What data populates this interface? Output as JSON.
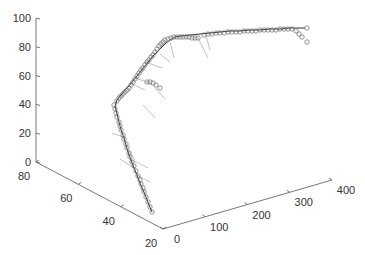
{
  "chart_data": {
    "type": "scatter3d",
    "title": "",
    "xlabel": "",
    "ylabel": "",
    "zlabel": "",
    "xlim": [
      0,
      400
    ],
    "ylim": [
      20,
      80
    ],
    "zlim": [
      0,
      100
    ],
    "x_ticks": [
      "0",
      "100",
      "200",
      "300",
      "400"
    ],
    "y_ticks": [
      "20",
      "40",
      "60",
      "80"
    ],
    "z_ticks": [
      "0",
      "20",
      "40",
      "60",
      "80",
      "100"
    ],
    "grid": false,
    "legend": [],
    "series": [
      {
        "name": "fitted-curve",
        "style": "line",
        "color": "#333333"
      },
      {
        "name": "observations",
        "style": "circle-markers",
        "color": "#555555"
      },
      {
        "name": "residual-vectors",
        "style": "thin-lines",
        "color": "#aaaaaa"
      }
    ],
    "screen_path_points": [
      [
        152,
        212
      ],
      [
        149,
        205
      ],
      [
        146,
        197
      ],
      [
        143,
        190
      ],
      [
        140,
        183
      ],
      [
        137,
        175
      ],
      [
        134,
        168
      ],
      [
        131,
        160
      ],
      [
        128,
        152
      ],
      [
        126,
        145
      ],
      [
        124,
        138
      ],
      [
        121,
        130
      ],
      [
        119,
        122
      ],
      [
        117,
        114
      ],
      [
        115,
        106
      ],
      [
        117,
        100
      ],
      [
        121,
        95
      ],
      [
        125,
        90
      ],
      [
        129,
        86
      ],
      [
        133,
        81
      ],
      [
        137,
        76
      ],
      [
        141,
        71
      ],
      [
        145,
        66
      ],
      [
        149,
        61
      ],
      [
        153,
        56
      ],
      [
        157,
        52
      ],
      [
        161,
        48
      ],
      [
        165,
        44
      ],
      [
        170,
        40
      ],
      [
        175,
        37
      ],
      [
        180,
        36
      ],
      [
        190,
        35
      ],
      [
        200,
        34
      ],
      [
        210,
        33
      ],
      [
        220,
        32
      ],
      [
        230,
        31
      ],
      [
        240,
        31
      ],
      [
        250,
        30
      ],
      [
        260,
        30
      ],
      [
        270,
        29
      ],
      [
        280,
        29
      ],
      [
        290,
        28
      ],
      [
        300,
        28
      ],
      [
        305,
        28
      ]
    ],
    "screen_markers": [
      [
        152,
        212
      ],
      [
        150,
        207
      ],
      [
        148,
        202
      ],
      [
        146,
        197
      ],
      [
        144,
        192
      ],
      [
        143,
        188
      ],
      [
        141,
        184
      ],
      [
        140,
        180
      ],
      [
        138,
        176
      ],
      [
        136,
        171
      ],
      [
        134,
        166
      ],
      [
        132,
        162
      ],
      [
        130,
        157
      ],
      [
        129,
        153
      ],
      [
        127,
        148
      ],
      [
        126,
        144
      ],
      [
        124,
        139
      ],
      [
        123,
        135
      ],
      [
        121,
        130
      ],
      [
        120,
        126
      ],
      [
        119,
        122
      ],
      [
        117,
        117
      ],
      [
        116,
        113
      ],
      [
        115,
        109
      ],
      [
        114,
        105
      ],
      [
        117,
        101
      ],
      [
        119,
        98
      ],
      [
        121,
        96
      ],
      [
        123,
        94
      ],
      [
        125,
        92
      ],
      [
        127,
        90
      ],
      [
        129,
        88
      ],
      [
        131,
        85
      ],
      [
        133,
        82
      ],
      [
        135,
        79
      ],
      [
        137,
        76
      ],
      [
        139,
        73
      ],
      [
        141,
        70
      ],
      [
        143,
        68
      ],
      [
        145,
        65
      ],
      [
        147,
        62
      ],
      [
        149,
        60
      ],
      [
        151,
        57
      ],
      [
        153,
        55
      ],
      [
        155,
        52
      ],
      [
        157,
        49
      ],
      [
        159,
        46
      ],
      [
        161,
        44
      ],
      [
        163,
        42
      ],
      [
        165,
        40
      ],
      [
        168,
        39
      ],
      [
        171,
        38
      ],
      [
        174,
        37
      ],
      [
        177,
        37
      ],
      [
        160,
        88
      ],
      [
        156,
        85
      ],
      [
        153,
        83
      ],
      [
        150,
        82
      ],
      [
        147,
        82
      ],
      [
        180,
        37
      ],
      [
        183,
        37
      ],
      [
        186,
        37
      ],
      [
        189,
        37
      ],
      [
        192,
        38
      ],
      [
        195,
        38
      ],
      [
        198,
        38
      ],
      [
        204,
        35
      ],
      [
        208,
        34
      ],
      [
        212,
        34
      ],
      [
        216,
        33
      ],
      [
        220,
        33
      ],
      [
        224,
        33
      ],
      [
        228,
        32
      ],
      [
        232,
        32
      ],
      [
        236,
        32
      ],
      [
        240,
        32
      ],
      [
        244,
        31
      ],
      [
        248,
        31
      ],
      [
        252,
        31
      ],
      [
        256,
        31
      ],
      [
        260,
        30
      ],
      [
        264,
        30
      ],
      [
        268,
        30
      ],
      [
        272,
        30
      ],
      [
        276,
        30
      ],
      [
        280,
        29
      ],
      [
        284,
        29
      ],
      [
        288,
        29
      ],
      [
        292,
        29
      ],
      [
        296,
        31
      ],
      [
        299,
        34
      ],
      [
        302,
        37
      ],
      [
        307,
        42
      ],
      [
        307,
        28
      ]
    ],
    "screen_residuals": [
      [
        [
          137,
          175
        ],
        [
          150,
          182
        ]
      ],
      [
        [
          134,
          168
        ],
        [
          120,
          159
        ]
      ],
      [
        [
          132,
          160
        ],
        [
          148,
          168
        ]
      ],
      [
        [
          123,
          137
        ],
        [
          112,
          133
        ]
      ],
      [
        [
          128,
          150
        ],
        [
          135,
          160
        ]
      ],
      [
        [
          130,
          83
        ],
        [
          145,
          90
        ]
      ],
      [
        [
          135,
          78
        ],
        [
          150,
          83
        ]
      ],
      [
        [
          143,
          105
        ],
        [
          155,
          118
        ]
      ],
      [
        [
          155,
          88
        ],
        [
          165,
          99
        ]
      ],
      [
        [
          145,
          62
        ],
        [
          162,
          68
        ]
      ],
      [
        [
          160,
          54
        ],
        [
          170,
          62
        ]
      ],
      [
        [
          170,
          42
        ],
        [
          174,
          58
        ]
      ],
      [
        [
          198,
          38
        ],
        [
          208,
          58
        ]
      ],
      [
        [
          206,
          36
        ],
        [
          210,
          50
        ]
      ]
    ]
  }
}
